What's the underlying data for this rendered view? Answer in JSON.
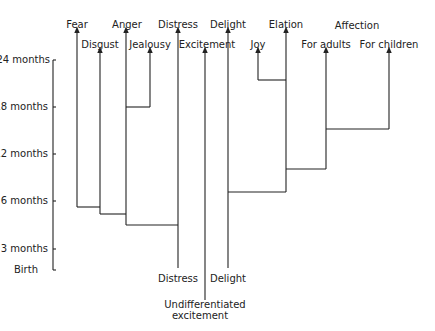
{
  "axis": {
    "ticks": [
      {
        "label": "24 months",
        "y": 60
      },
      {
        "label": "18 months",
        "y": 107
      },
      {
        "label": "12 months",
        "y": 154
      },
      {
        "label": "6 months",
        "y": 201
      },
      {
        "label": "3 months",
        "y": 249
      },
      {
        "label": "Birth",
        "y": 270
      }
    ]
  },
  "top_labels": {
    "fear": "Fear",
    "disgust": "Disgust",
    "anger": "Anger",
    "jealousy": "Jealousy",
    "distress": "Distress",
    "excitement": "Excitement",
    "delight": "Delight",
    "joy": "Joy",
    "elation": "Elation",
    "affection": "Affection",
    "for_adults": "For adults",
    "for_children": "For children"
  },
  "bottom_labels": {
    "distress": "Distress",
    "delight": "Delight",
    "undiff_line1": "Undifferentiated",
    "undiff_line2": "excitement"
  }
}
